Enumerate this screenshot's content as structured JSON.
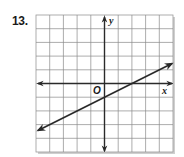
{
  "problem": {
    "number": "13."
  },
  "graph": {
    "x_label": "x",
    "y_label": "y",
    "origin_label": "O",
    "grid": {
      "x_min": -5,
      "x_max": 5,
      "y_min": -5,
      "y_max": 5,
      "step": 1
    },
    "colors": {
      "grid": "#8a8a8a",
      "axis": "#2a2a2a",
      "line": "#2a2a2a",
      "shadow": "#c8c8c8"
    }
  },
  "chart_data": {
    "type": "line",
    "title": "",
    "xlabel": "x",
    "ylabel": "y",
    "xlim": [
      -5,
      5
    ],
    "ylim": [
      -5,
      5
    ],
    "grid": true,
    "series": [
      {
        "name": "y = 1/2 x - 1",
        "slope": 0.5,
        "y_intercept": -1,
        "x_intercept": 2,
        "x": [
          -5,
          5
        ],
        "y": [
          -3.5,
          1.5
        ],
        "arrows": "both"
      }
    ]
  }
}
